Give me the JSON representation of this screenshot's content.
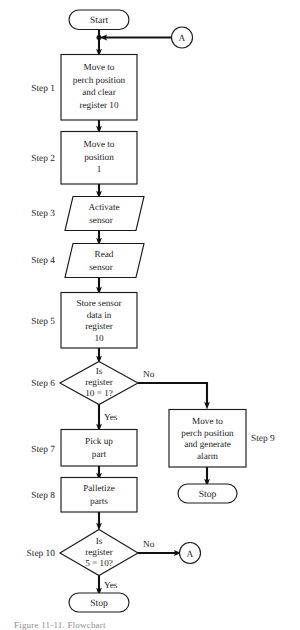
{
  "figure": {
    "type": "flowchart",
    "background_color": "#ffffff",
    "line_color": "#111111",
    "text_color": "#1a1a1a"
  },
  "terminators": {
    "start": "Start",
    "stop_alarm": "Stop",
    "stop_end": "Stop"
  },
  "connectors": {
    "top_a": "A",
    "bottom_a": "A"
  },
  "branch_labels": {
    "step6_no": "No",
    "step6_yes": "Yes",
    "step10_no": "No",
    "step10_yes": "Yes"
  },
  "step_labels": {
    "step1": "Step 1",
    "step2": "Step 2",
    "step3": "Step 3",
    "step4": "Step 4",
    "step5": "Step 5",
    "step6": "Step 6",
    "step7": "Step 7",
    "step8": "Step 8",
    "step9": "Step 9",
    "step10": "Step 10"
  },
  "nodes": {
    "step1": {
      "shape": "process",
      "lines": [
        "Move to",
        "perch position",
        "and clear",
        "register 10"
      ]
    },
    "step2": {
      "shape": "process",
      "lines": [
        "Move to",
        "position",
        "1"
      ]
    },
    "step3": {
      "shape": "io",
      "lines": [
        "Activate",
        "sensor"
      ]
    },
    "step4": {
      "shape": "io",
      "lines": [
        "Read",
        "sensor"
      ]
    },
    "step5": {
      "shape": "process",
      "lines": [
        "Store sensor",
        "data in",
        "register",
        "10"
      ]
    },
    "step6": {
      "shape": "decision",
      "lines": [
        "Is",
        "register",
        "10 = 1?"
      ]
    },
    "step7": {
      "shape": "process",
      "lines": [
        "Pick up",
        "part"
      ]
    },
    "step8": {
      "shape": "process",
      "lines": [
        "Palletize",
        "parts"
      ]
    },
    "step9": {
      "shape": "process",
      "lines": [
        "Move to",
        "perch position",
        "and generate",
        "alarm"
      ]
    },
    "step10": {
      "shape": "decision",
      "lines": [
        "Is",
        "register",
        "5 = 10?"
      ]
    }
  },
  "caption": "Figure 11-11. Flowchart"
}
